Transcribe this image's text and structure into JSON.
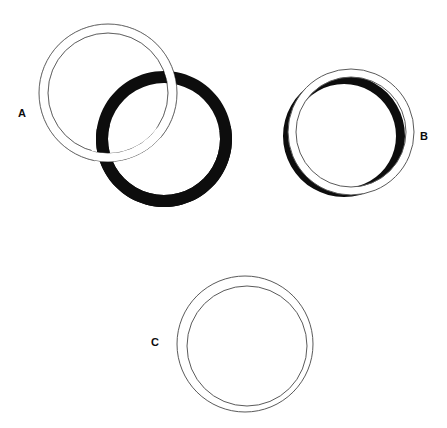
{
  "page": {
    "background_color": "#ffffff",
    "width": 447,
    "height": 428
  },
  "colors": {
    "background": "#ffffff",
    "outline": "#5a5a5a",
    "solid_ring": "#0d0d0d",
    "label_text": "#0d0d0d",
    "ring_fill": "#ffffff"
  },
  "figures": [
    {
      "id": "A",
      "label": "A",
      "label_position": {
        "x": 18,
        "y": 108
      },
      "description": "Two interlocked rings: an outlined white ring and a solid black ring",
      "rings": [
        {
          "name": "white-ring",
          "style": "outline",
          "center": {
            "x": 108,
            "y": 93
          },
          "outer_radius": 69,
          "inner_radius": 60,
          "stroke_color": "#5a5a5a",
          "stroke_width": 1,
          "fill": "#ffffff"
        },
        {
          "name": "black-ring",
          "style": "solid",
          "center": {
            "x": 164,
            "y": 139
          },
          "outer_radius": 68,
          "inner_radius": 56,
          "stroke_color": "#0d0d0d",
          "fill": "#0d0d0d"
        }
      ],
      "interlock": "black ring passes behind white ring at top-right, white ring passes behind black ring at lower-left"
    },
    {
      "id": "B",
      "label": "B",
      "label_position": {
        "x": 420,
        "y": 131
      },
      "description": "A solid black ring nearly concentric with an outlined white ring, offset down-left",
      "rings": [
        {
          "name": "black-ring",
          "style": "solid",
          "center": {
            "x": 344,
            "y": 136
          },
          "outer_radius": 61,
          "inner_radius": 52,
          "stroke_color": "#0d0d0d",
          "fill": "#0d0d0d"
        },
        {
          "name": "white-ring",
          "style": "outline",
          "center": {
            "x": 351,
            "y": 132
          },
          "outer_radius": 63,
          "inner_radius": 55,
          "stroke_color": "#5a5a5a",
          "stroke_width": 1,
          "fill": "#ffffff"
        }
      ],
      "interlock": "white ring overlaps in front of black ring; black ring visible as crescent at left and bottom"
    },
    {
      "id": "C",
      "label": "C",
      "label_position": {
        "x": 151,
        "y": 337
      },
      "description": "A single outlined white ring drawn as two thin concentric circles",
      "rings": [
        {
          "name": "white-ring",
          "style": "outline",
          "center": {
            "x": 245,
            "y": 344
          },
          "outer_radius": 68,
          "inner_radius": 60,
          "stroke_color": "#5a5a5a",
          "stroke_width": 1,
          "fill": "#ffffff"
        }
      ],
      "interlock": "none"
    }
  ]
}
